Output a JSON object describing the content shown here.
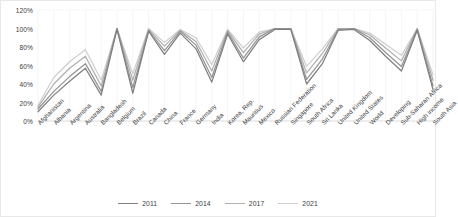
{
  "chart_data": {
    "type": "line",
    "title": "",
    "subtitle": "",
    "xlabel": "",
    "ylabel": "",
    "ylim": [
      0,
      120
    ],
    "ytick_labels": [
      "0%",
      "20%",
      "40%",
      "60%",
      "80%",
      "100%",
      "120%"
    ],
    "ytick_values": [
      0,
      20,
      40,
      60,
      80,
      100,
      120
    ],
    "grid": true,
    "grid_orientation": "vertical",
    "legend_position": "bottom",
    "categories": [
      "Afghanistan",
      "Albania",
      "Argentina",
      "Australia",
      "Bangladesh",
      "Belgium",
      "Brazil",
      "Canada",
      "China",
      "France",
      "Germany",
      "India",
      "Korea, Rep.",
      "Mauritius",
      "Mexico",
      "Russian Federation",
      "Singapore",
      "South Africa",
      "Sri Lanka",
      "United Kingdom",
      "United States",
      "World",
      "Developing",
      "Sub-Saharan Africa",
      "High income",
      "South Asia"
    ],
    "series": [
      {
        "name": "2011",
        "color": "#808080",
        "values": [
          10,
          28,
          43,
          57,
          28,
          99,
          30,
          97,
          72,
          95,
          78,
          42,
          94,
          64,
          88,
          99,
          99,
          40,
          62,
          98,
          99,
          87,
          70,
          54,
          98,
          34
        ]
      },
      {
        "name": "2014",
        "color": "#949494",
        "values": [
          13,
          32,
          48,
          62,
          32,
          100,
          36,
          98,
          76,
          97,
          82,
          47,
          96,
          68,
          91,
          100,
          100,
          45,
          67,
          99,
          100,
          90,
          74,
          59,
          99,
          38
        ]
      },
      {
        "name": "2017",
        "color": "#b0b0b0",
        "values": [
          15,
          40,
          57,
          70,
          38,
          100,
          44,
          99,
          81,
          98,
          86,
          54,
          98,
          74,
          94,
          100,
          100,
          52,
          73,
          100,
          100,
          93,
          79,
          65,
          100,
          44
        ]
      },
      {
        "name": "2021",
        "color": "#cfcfcf",
        "values": [
          17,
          47,
          64,
          77,
          44,
          100,
          51,
          100,
          85,
          99,
          90,
          61,
          99,
          79,
          96,
          100,
          100,
          59,
          78,
          100,
          100,
          95,
          83,
          71,
          100,
          50
        ]
      }
    ]
  },
  "legend": {
    "items": [
      {
        "label": "2011"
      },
      {
        "label": "2014"
      },
      {
        "label": "2017"
      },
      {
        "label": "2021"
      }
    ]
  },
  "colors": {
    "grid": "#f0f0f0",
    "axis": "#d9d9d9",
    "text": "#3b3b3b",
    "background": "#ffffff",
    "border": "#e8e8e8"
  }
}
